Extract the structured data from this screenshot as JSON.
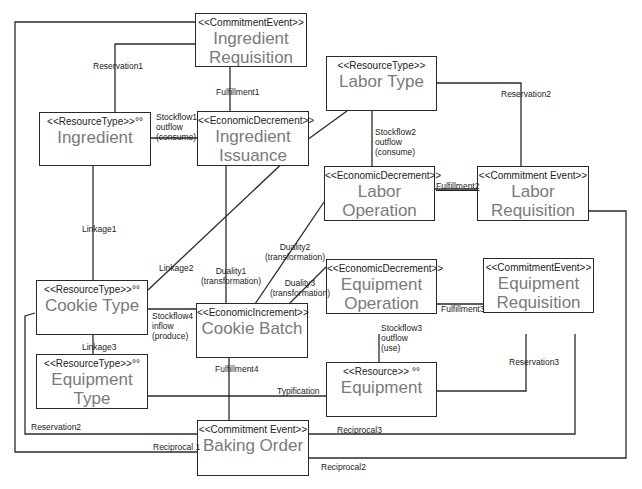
{
  "boxes": {
    "ingredient_requisition": {
      "stereotype": "<<CommitmentEvent>>",
      "name": "Ingredient Requisition"
    },
    "ingredient": {
      "stereotype": "<<ResourceType>>°°",
      "name": "Ingredient"
    },
    "ingredient_issuance": {
      "stereotype": "<<EconomicDecrement>>",
      "name": "Ingredient Issuance"
    },
    "labor_type": {
      "stereotype": "<<ResourceType>>",
      "name": "Labor Type"
    },
    "labor_operation": {
      "stereotype": "<<EconomicDecrement>>",
      "name": "Labor Operation"
    },
    "labor_requisition": {
      "stereotype": "<<Commitment Event>>",
      "name": "Labor Requisition"
    },
    "cookie_type": {
      "stereotype": "<<ResourceType>>°°",
      "name": "Cookie Type"
    },
    "cookie_batch": {
      "stereotype": "<<EconomicIncrement>>",
      "name": "Cookie Batch"
    },
    "equipment_operation": {
      "stereotype": "<<EconomicDecrement>>",
      "name": "Equipment Operation"
    },
    "equipment_requisition": {
      "stereotype": "<<CommitmentEvent>>",
      "name": "Equipment Requisition"
    },
    "equipment_type": {
      "stereotype": "<<ResourceType>>°°",
      "name": "Equipment Type"
    },
    "equipment": {
      "stereotype": "<<Resource>> °°",
      "name": "Equipment"
    },
    "baking_order": {
      "stereotype": "<<Commitment Event>>",
      "name": "Baking Order"
    }
  },
  "labels": {
    "reservation1": "Reservation1",
    "fulfillment1": "Fulfillment1",
    "stockflow1": "Stockflow1\noutflow\n(consume)",
    "reservation2_top": "Reservation2",
    "stockflow2": "Stockflow2\noutflow\n(consume)",
    "fulfillment2": "Fulfillment2",
    "linkage1": "Linkage1",
    "linkage2": "Linkage2",
    "duality1": "Duality1\n(transformation)",
    "duality2": "Duality2\n(transformation)",
    "duality3": "Duality3\n(transformation)",
    "stockflow4": "Stockflow4\ninflow\n(produce)",
    "fulfillment3": "Fulfillment3",
    "linkage3": "Linkage3",
    "fulfillment4": "Fulfillment4",
    "stockflow3": "Stockflow3\noutflow\n(use)",
    "reservation3": "Reservation3",
    "typification": "Typification",
    "reservation2_bottom": "Reservation2",
    "reciprocal1": "Reciprocal 1",
    "reciprocal3": "Reciprocal3",
    "reciprocal2": "Reciprocal2"
  },
  "colors": {
    "line": "#2a2a2a",
    "name_text": "#7a7a7a"
  }
}
